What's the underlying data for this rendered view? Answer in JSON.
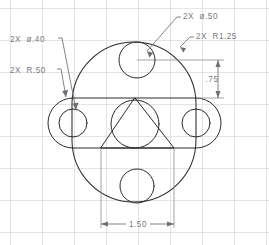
{
  "drawing": {
    "title": "Mechanical Part Orthographic View",
    "background_color": "#ffffff",
    "grid_color": "#e4e4e8",
    "line_color": "#2b2b2b",
    "annotation_color": "#7a7a82",
    "grid_spacing_px": 32
  },
  "annotations": [
    {
      "id": "dia-40",
      "label": "2X  ø.40",
      "text_x": 10,
      "text_y": 42,
      "describes": "two-small-bolt-holes-diameter"
    },
    {
      "id": "r-50",
      "label": "2X  R.50",
      "text_x": 10,
      "text_y": 73,
      "describes": "slot-end-radius"
    },
    {
      "id": "dia-50",
      "label": "2X  ø.50",
      "text_x": 183,
      "text_y": 19,
      "describes": "top-and-bottom-hole-diameter"
    },
    {
      "id": "r-125",
      "label": "2X  R1.25",
      "text_x": 196,
      "text_y": 39,
      "describes": "main-body-outer-radius"
    }
  ],
  "dimensions": [
    {
      "id": "vertical-75",
      "value": ".75",
      "orientation": "vertical",
      "text_x": 215,
      "text_y": 82,
      "from": "top-hole-centerline",
      "to": "slot-top-edge"
    },
    {
      "id": "horizontal-150",
      "value": "1.50",
      "orientation": "horizontal",
      "text_x": 138,
      "text_y": 232,
      "from": "triangle-left-corner",
      "to": "triangle-right-corner"
    }
  ],
  "geometry": {
    "body": {
      "name": "main-body-obround",
      "center_x": 134,
      "center_y": 122,
      "radius": 62,
      "top_arc_cy": 104,
      "bottom_arc_cy": 140
    },
    "slot": {
      "name": "horizontal-slot",
      "left_x": 60,
      "right_x": 208,
      "center_y": 123,
      "half_height": 25
    },
    "circles": [
      {
        "name": "top-hole",
        "cx": 137,
        "cy": 60,
        "r": 18
      },
      {
        "name": "bottom-hole",
        "cx": 137,
        "cy": 186,
        "r": 17
      },
      {
        "name": "center-hole",
        "cx": 135,
        "cy": 124,
        "r": 24
      },
      {
        "name": "left-hole",
        "cx": 73,
        "cy": 123,
        "r": 14
      },
      {
        "name": "right-hole",
        "cx": 196,
        "cy": 123,
        "r": 14
      }
    ],
    "triangle": {
      "name": "inner-triangle",
      "apex_x": 135,
      "apex_y": 98,
      "left_x": 101,
      "right_x": 174,
      "base_y": 148
    }
  }
}
